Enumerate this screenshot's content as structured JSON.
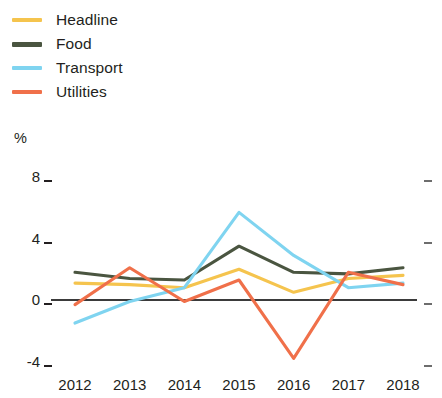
{
  "chart_data": {
    "type": "line",
    "title": "",
    "subtitle": "",
    "xlabel": "",
    "ylabel": "%",
    "unit_label": "%",
    "categories": [
      "2012",
      "2013",
      "2014",
      "2015",
      "2016",
      "2017",
      "2018"
    ],
    "x": [
      2012,
      2013,
      2014,
      2015,
      2016,
      2017,
      2018
    ],
    "ylim": [
      -5.2,
      8.8
    ],
    "xlim": [
      2011.6,
      2018.5
    ],
    "yticks": [
      8,
      4,
      0,
      -4
    ],
    "ytick_labels": [
      "8",
      "4",
      "0",
      "-4"
    ],
    "grid": false,
    "legend_position": "top-left",
    "zero_line": true,
    "series": [
      {
        "name": "Headline",
        "color": "#f5c44e",
        "values": [
          1.1,
          1.0,
          0.8,
          2.0,
          0.5,
          1.4,
          1.6
        ]
      },
      {
        "name": "Food",
        "color": "#4a5540",
        "values": [
          1.8,
          1.4,
          1.3,
          3.5,
          1.8,
          1.7,
          2.1
        ]
      },
      {
        "name": "Transport",
        "color": "#7fd4f0",
        "values": [
          -1.5,
          -0.1,
          0.8,
          5.7,
          2.9,
          0.8,
          1.1
        ]
      },
      {
        "name": "Utilities",
        "color": "#f0704a",
        "values": [
          -0.3,
          2.1,
          -0.1,
          1.3,
          -3.8,
          1.8,
          1.0
        ]
      }
    ]
  },
  "legend": {
    "items": [
      {
        "label": "Headline",
        "color": "#f5c44e"
      },
      {
        "label": "Food",
        "color": "#4a5540"
      },
      {
        "label": "Transport",
        "color": "#7fd4f0"
      },
      {
        "label": "Utilities",
        "color": "#f0704a"
      }
    ]
  },
  "axes": {
    "unit": "%",
    "y_labels": [
      "8",
      "4",
      "0",
      "-4"
    ],
    "x_labels": [
      "2012",
      "2013",
      "2014",
      "2015",
      "2016",
      "2017",
      "2018"
    ]
  }
}
